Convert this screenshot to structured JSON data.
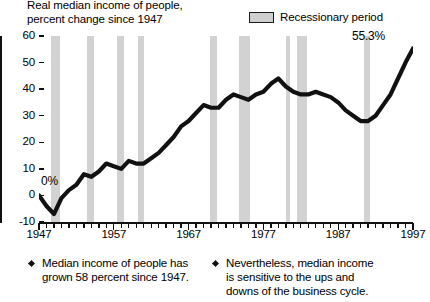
{
  "chart_data": {
    "type": "line",
    "title": "Real median income of people, percent change since 1947",
    "title_line1": "Real median income of people,",
    "title_line2": "percent change since 1947",
    "xlabel": "",
    "ylabel": "",
    "xlim": [
      1947,
      1997
    ],
    "ylim": [
      -10,
      60
    ],
    "ytick_labels": [
      "60",
      "50",
      "40",
      "30",
      "20",
      "10",
      "0",
      "-10"
    ],
    "ytick_values": [
      60,
      50,
      40,
      30,
      20,
      10,
      0,
      -10
    ],
    "xtick_labels": [
      "1947",
      "1957",
      "1967",
      "1977",
      "1987",
      "1997"
    ],
    "xtick_values": [
      1947,
      1957,
      1967,
      1977,
      1987,
      1997
    ],
    "grid": false,
    "legend": [
      {
        "label": "Recessionary period",
        "color": "#d2d2d2",
        "border": "#1a1a1a"
      }
    ],
    "legend_position": "top-right",
    "series": [
      {
        "name": "Real median income of people, percent change since 1947",
        "color": "#111111",
        "x": [
          1947,
          1948,
          1949,
          1950,
          1951,
          1952,
          1953,
          1954,
          1955,
          1956,
          1957,
          1958,
          1959,
          1960,
          1961,
          1962,
          1963,
          1964,
          1965,
          1966,
          1967,
          1968,
          1969,
          1970,
          1971,
          1972,
          1973,
          1974,
          1975,
          1976,
          1977,
          1978,
          1979,
          1980,
          1981,
          1982,
          1983,
          1984,
          1985,
          1986,
          1987,
          1988,
          1989,
          1990,
          1991,
          1992,
          1993,
          1994,
          1995,
          1996,
          1997
        ],
        "values": [
          0,
          -4,
          -7,
          -1,
          2,
          4,
          8,
          7,
          9,
          12,
          11,
          10,
          13,
          12,
          12,
          14,
          16,
          19,
          22,
          26,
          28,
          31,
          34,
          33,
          33,
          36,
          38,
          37,
          36,
          38,
          39,
          42,
          44,
          41,
          39,
          38,
          38,
          39,
          38,
          37,
          35,
          32,
          30,
          28,
          28,
          30,
          34,
          38,
          44,
          50,
          55.3
        ]
      }
    ],
    "annotations": [
      {
        "name": "start-value",
        "text": "0%",
        "x": 1947,
        "y": 0
      },
      {
        "name": "end-value",
        "text": "55.3%",
        "x": 1997,
        "y": 55.3
      }
    ],
    "recession_bands": [
      {
        "start": 1948.6,
        "end": 1949.8
      },
      {
        "start": 1953.4,
        "end": 1954.4
      },
      {
        "start": 1957.4,
        "end": 1958.4
      },
      {
        "start": 1960.2,
        "end": 1961.1
      },
      {
        "start": 1969.8,
        "end": 1970.8
      },
      {
        "start": 1973.8,
        "end": 1975.2
      },
      {
        "start": 1980.0,
        "end": 1980.5
      },
      {
        "start": 1981.5,
        "end": 1982.8
      },
      {
        "start": 1990.5,
        "end": 1991.2
      }
    ]
  },
  "footnotes": [
    {
      "lines": [
        "Median income of people has",
        "grown 58 percent since 1947."
      ]
    },
    {
      "lines": [
        "Nevertheless, median income",
        "is sensitive to the ups and",
        "downs of the business cycle."
      ]
    }
  ]
}
